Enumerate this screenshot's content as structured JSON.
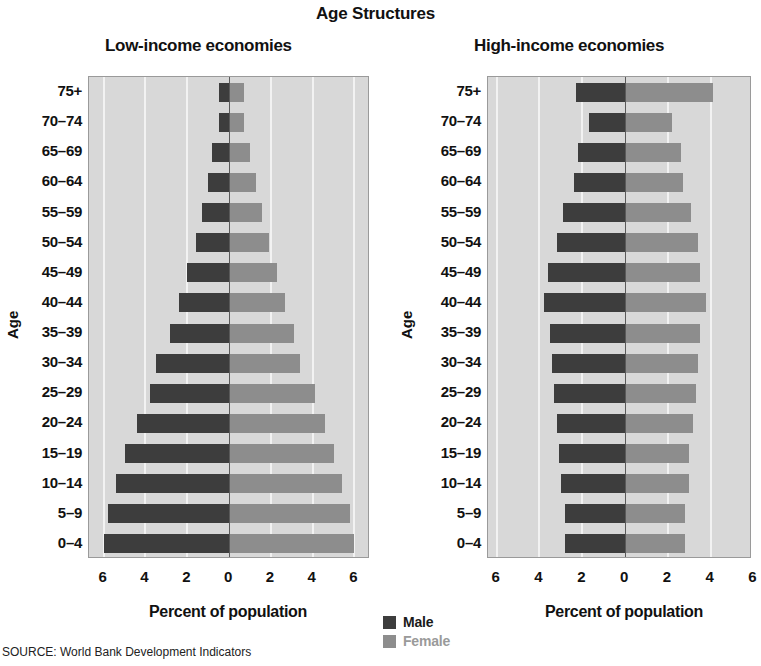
{
  "title": "Age Structures",
  "source_note": "SOURCE: World Bank Development Indicators",
  "legend": {
    "male_label": "Male",
    "female_label": "Female",
    "male_color": "#3d3d3d",
    "female_color": "#8d8d8d"
  },
  "panels": [
    {
      "title": "Low-income economies",
      "xlabel": "Percent of population",
      "ylabel": "Age"
    },
    {
      "title": "High-income economies",
      "xlabel": "Percent of population",
      "ylabel": "Age"
    }
  ],
  "chart_data": [
    {
      "type": "bar",
      "subtype": "population-pyramid",
      "title": "Low-income economies",
      "xlabel": "Percent of population",
      "ylabel": "Age",
      "xlim": [
        -6,
        6
      ],
      "xticks": [
        6,
        4,
        2,
        0,
        2,
        4,
        6
      ],
      "grid": true,
      "legend_position": "bottom-center",
      "categories": [
        "75+",
        "70–74",
        "65–69",
        "60–64",
        "55–59",
        "50–54",
        "45–49",
        "40–44",
        "35–39",
        "30–34",
        "25–29",
        "20–24",
        "15–19",
        "10–14",
        "5–9",
        "0–4"
      ],
      "series": [
        {
          "name": "Male",
          "color": "#3d3d3d",
          "values": [
            0.5,
            0.5,
            0.8,
            1.0,
            1.3,
            1.6,
            2.0,
            2.4,
            2.8,
            3.5,
            3.8,
            4.4,
            5.0,
            5.4,
            5.8,
            6.0
          ]
        },
        {
          "name": "Female",
          "color": "#8d8d8d",
          "values": [
            0.7,
            0.7,
            1.0,
            1.3,
            1.6,
            1.9,
            2.3,
            2.7,
            3.1,
            3.4,
            4.1,
            4.6,
            5.0,
            5.4,
            5.8,
            6.0
          ]
        }
      ]
    },
    {
      "type": "bar",
      "subtype": "population-pyramid",
      "title": "High-income economies",
      "xlabel": "Percent of population",
      "ylabel": "Age",
      "xlim": [
        -6,
        6
      ],
      "xticks": [
        6,
        4,
        2,
        0,
        2,
        4,
        6
      ],
      "grid": true,
      "legend_position": "bottom-center",
      "categories": [
        "75+",
        "70–74",
        "65–69",
        "60–64",
        "55–59",
        "50–54",
        "45–49",
        "40–44",
        "35–39",
        "30–34",
        "25–29",
        "20–24",
        "15–19",
        "10–14",
        "5–9",
        "0–4"
      ],
      "series": [
        {
          "name": "Male",
          "color": "#3d3d3d",
          "values": [
            2.3,
            1.7,
            2.2,
            2.4,
            2.9,
            3.2,
            3.6,
            3.8,
            3.5,
            3.4,
            3.3,
            3.2,
            3.1,
            3.0,
            2.8,
            2.8
          ]
        },
        {
          "name": "Female",
          "color": "#8d8d8d",
          "values": [
            4.1,
            2.2,
            2.6,
            2.7,
            3.1,
            3.4,
            3.5,
            3.8,
            3.5,
            3.4,
            3.3,
            3.2,
            3.0,
            3.0,
            2.8,
            2.8
          ]
        }
      ]
    }
  ]
}
